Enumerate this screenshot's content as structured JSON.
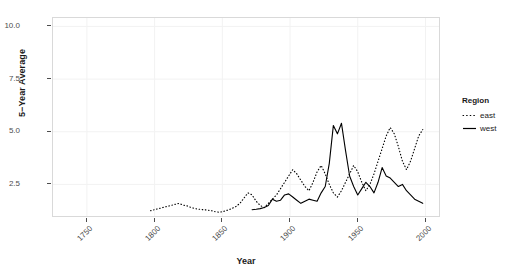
{
  "chart_data": {
    "type": "line",
    "title": "",
    "xlabel": "Year",
    "ylabel": "5−Year Average",
    "xlim": [
      1725,
      2010
    ],
    "ylim": [
      1.0,
      10.4
    ],
    "grid": true,
    "legend_position": "right",
    "legend_title": "Region",
    "xticks": [
      1750,
      1800,
      1850,
      1900,
      1950,
      2000
    ],
    "xtick_labels": [
      "1750",
      "1800",
      "1850",
      "1900",
      "1950",
      "2000"
    ],
    "yticks": [
      2.5,
      5.0,
      7.5,
      10.0
    ],
    "ytick_labels": [
      "2.5",
      "5.0",
      "7.5",
      "10.0"
    ],
    "series": [
      {
        "name": "east",
        "style": "dotted",
        "color": "#000000",
        "x": [
          1797,
          1800,
          1803,
          1806,
          1809,
          1812,
          1815,
          1818,
          1821,
          1824,
          1827,
          1830,
          1833,
          1836,
          1839,
          1842,
          1845,
          1848,
          1851,
          1854,
          1857,
          1860,
          1863,
          1866,
          1869,
          1872,
          1875,
          1878,
          1881,
          1884,
          1887,
          1890,
          1893,
          1896,
          1899,
          1902,
          1905,
          1908,
          1911,
          1914,
          1917,
          1920,
          1923,
          1926,
          1929,
          1932,
          1935,
          1938,
          1941,
          1944,
          1947,
          1950,
          1953,
          1956,
          1959,
          1962,
          1965,
          1968,
          1971,
          1974,
          1977,
          1980,
          1983,
          1986,
          1989,
          1992,
          1995,
          1998
        ],
        "values": [
          1.25,
          1.3,
          1.35,
          1.4,
          1.45,
          1.5,
          1.55,
          1.6,
          1.52,
          1.48,
          1.4,
          1.35,
          1.32,
          1.3,
          1.28,
          1.25,
          1.2,
          1.18,
          1.22,
          1.28,
          1.35,
          1.45,
          1.6,
          1.85,
          2.1,
          2.0,
          1.7,
          1.5,
          1.4,
          1.6,
          1.8,
          2.0,
          2.3,
          2.6,
          2.9,
          3.2,
          3.0,
          2.7,
          2.4,
          2.2,
          2.6,
          3.1,
          3.4,
          3.0,
          2.5,
          2.1,
          1.9,
          2.2,
          2.6,
          3.0,
          3.4,
          3.1,
          2.6,
          2.2,
          2.5,
          3.0,
          3.6,
          4.2,
          4.8,
          5.2,
          4.9,
          4.3,
          3.6,
          3.2,
          3.6,
          4.2,
          4.8,
          5.1
        ]
      },
      {
        "name": "west",
        "style": "solid",
        "color": "#000000",
        "x": [
          1872,
          1875,
          1878,
          1881,
          1884,
          1887,
          1890,
          1893,
          1896,
          1899,
          1902,
          1905,
          1908,
          1911,
          1914,
          1917,
          1920,
          1923,
          1926,
          1929,
          1932,
          1935,
          1938,
          1941,
          1944,
          1947,
          1950,
          1953,
          1956,
          1959,
          1962,
          1965,
          1968,
          1971,
          1974,
          1977,
          1980,
          1983,
          1986,
          1989,
          1992,
          1995,
          1998
        ],
        "values": [
          1.3,
          1.32,
          1.35,
          1.4,
          1.5,
          1.8,
          1.7,
          1.75,
          2.0,
          2.05,
          1.9,
          1.75,
          1.6,
          1.7,
          1.8,
          1.75,
          1.7,
          2.1,
          2.4,
          3.5,
          5.3,
          4.9,
          5.4,
          4.1,
          2.9,
          2.4,
          2.0,
          2.3,
          2.6,
          2.4,
          2.1,
          2.6,
          3.3,
          2.9,
          2.8,
          2.6,
          2.4,
          2.5,
          2.2,
          2.0,
          1.8,
          1.7,
          1.6
        ]
      }
    ]
  },
  "axes": {
    "y_title": "5−Year Average",
    "x_title": "Year",
    "ytick_labels": [
      "10.0",
      "7.5",
      "5.0",
      "2.5"
    ],
    "xtick_labels": [
      "1750",
      "1800",
      "1850",
      "1900",
      "1950",
      "2000"
    ]
  },
  "legend": {
    "title": "Region",
    "items": [
      {
        "label": "east",
        "style": "dotted"
      },
      {
        "label": "west",
        "style": "solid"
      }
    ]
  }
}
